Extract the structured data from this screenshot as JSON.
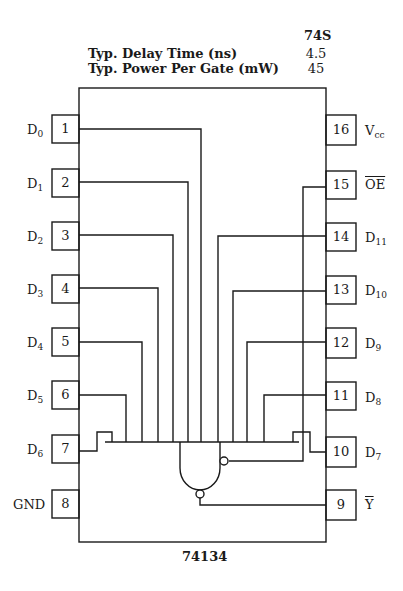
{
  "specs": {
    "family": "74S",
    "rows": [
      {
        "label": "Typ. Delay Time (ns)",
        "value": "4.5"
      },
      {
        "label": "Typ. Power Per Gate (mW)",
        "value": "45"
      }
    ]
  },
  "chip": {
    "part_number": "74134",
    "left_pins": [
      {
        "num": "1",
        "name": "D",
        "sub": "0"
      },
      {
        "num": "2",
        "name": "D",
        "sub": "1"
      },
      {
        "num": "3",
        "name": "D",
        "sub": "2"
      },
      {
        "num": "4",
        "name": "D",
        "sub": "3"
      },
      {
        "num": "5",
        "name": "D",
        "sub": "4"
      },
      {
        "num": "6",
        "name": "D",
        "sub": "5"
      },
      {
        "num": "7",
        "name": "D",
        "sub": "6"
      },
      {
        "num": "8",
        "name": "GND",
        "sub": ""
      }
    ],
    "right_pins": [
      {
        "num": "16",
        "name": "V",
        "sub": "cc"
      },
      {
        "num": "15",
        "name": "OE",
        "sub": "",
        "overline": true
      },
      {
        "num": "14",
        "name": "D",
        "sub": "11"
      },
      {
        "num": "13",
        "name": "D",
        "sub": "10"
      },
      {
        "num": "12",
        "name": "D",
        "sub": "9"
      },
      {
        "num": "11",
        "name": "D",
        "sub": "8"
      },
      {
        "num": "10",
        "name": "D",
        "sub": "7"
      },
      {
        "num": "9",
        "name": "Y",
        "sub": "",
        "overline": true
      }
    ],
    "gate": "12-input NAND with active-low enable (3-state output)"
  }
}
